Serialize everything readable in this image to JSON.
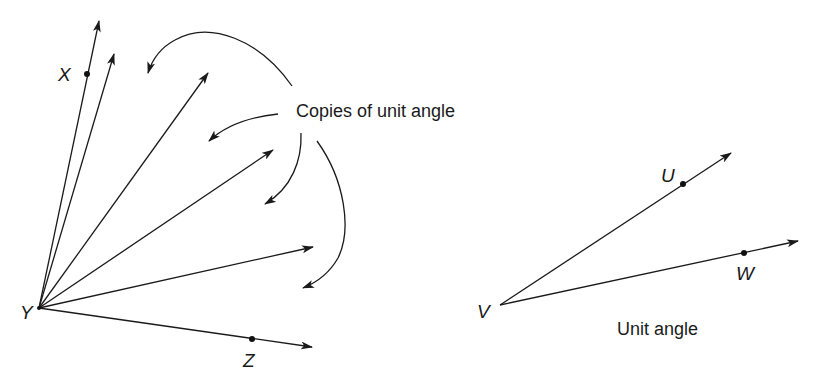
{
  "figure": {
    "left": {
      "vertex_label": "Y",
      "point_labels": {
        "x": "X",
        "z": "Z"
      },
      "caption": "Copies of unit angle",
      "ray_count": 7,
      "curved_arrow_count": 4
    },
    "right": {
      "vertex_label": "V",
      "point_labels": {
        "u": "U",
        "w": "W"
      },
      "caption": "Unit angle"
    }
  },
  "colors": {
    "ink": "#1a1a1a",
    "background": "#ffffff"
  }
}
